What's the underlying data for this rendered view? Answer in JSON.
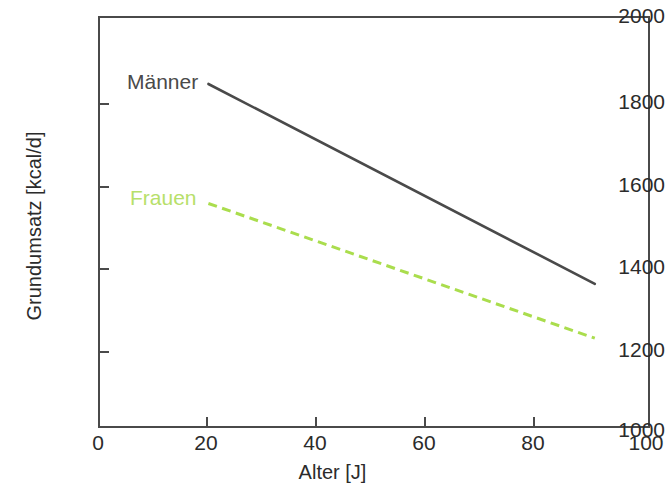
{
  "chart_data": {
    "type": "line",
    "title": "",
    "xlabel": "Alter [J]",
    "ylabel": "Grundumsatz [kcal/d]",
    "xlim": [
      0,
      100
    ],
    "ylim": [
      1000,
      2000
    ],
    "xticks": [
      "0",
      "20",
      "40",
      "60",
      "80",
      "100"
    ],
    "yticks": [
      "2000",
      "1800",
      "1600",
      "1400",
      "1200",
      "1000"
    ],
    "grid": false,
    "legend_position": "inline-annotations",
    "series": [
      {
        "name": "Männer",
        "style": "solid",
        "color": "#4a4a4a",
        "x": [
          20,
          90
        ],
        "values": [
          1835,
          1350
        ]
      },
      {
        "name": "Frauen",
        "style": "dashed",
        "color": "#aadd4d",
        "x": [
          20,
          90
        ],
        "values": [
          1545,
          1218
        ]
      }
    ],
    "annotations": [
      {
        "text": "Männer",
        "x": 20,
        "y": 1880
      },
      {
        "text": "Frauen",
        "x": 20,
        "y": 1600
      }
    ]
  },
  "axes": {
    "y": {
      "title": "Grundumsatz [kcal/d]",
      "ticks": [
        {
          "label": "2000",
          "top": 5
        },
        {
          "label": "1800",
          "top": 87
        },
        {
          "label": "1600",
          "top": 170
        },
        {
          "label": "1400",
          "top": 252
        },
        {
          "label": "1200",
          "top": 335
        },
        {
          "label": "1000",
          "top": 417
        }
      ]
    },
    "x": {
      "title": "Alter [J]",
      "ticks": [
        {
          "label": "0",
          "left": 58
        },
        {
          "label": "20",
          "left": 166
        },
        {
          "label": "40",
          "left": 275
        },
        {
          "label": "60",
          "left": 384
        },
        {
          "label": "80",
          "left": 493
        },
        {
          "label": "100",
          "left": 606
        }
      ]
    }
  },
  "colors": {
    "axis": "#4a4a4a",
    "maenner_line": "#4a4a4a",
    "frauen_line": "#aadd4d",
    "frauen_label": "#b7e06a",
    "background": "#ffffff"
  }
}
